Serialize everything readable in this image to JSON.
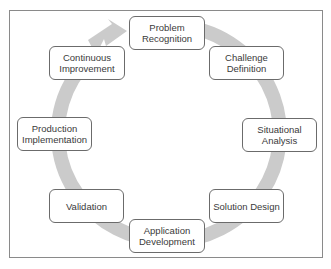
{
  "diagram": {
    "type": "cycle",
    "ring_color": "#cbcbcb",
    "frame_color": "#8a8a8a",
    "nodes": [
      {
        "id": "problem-recognition",
        "label": "Problem\nRecognition"
      },
      {
        "id": "challenge-definition",
        "label": "Challenge\nDefinition"
      },
      {
        "id": "situational-analysis",
        "label": "Situational\nAnalysis"
      },
      {
        "id": "solution-design",
        "label": "Solution Design"
      },
      {
        "id": "application-development",
        "label": "Application\nDevelopment"
      },
      {
        "id": "validation",
        "label": "Validation"
      },
      {
        "id": "production-implementation",
        "label": "Production\nImplementation"
      },
      {
        "id": "continuous-improvement",
        "label": "Continuous\nImprovement"
      }
    ],
    "direction": "clockwise"
  }
}
